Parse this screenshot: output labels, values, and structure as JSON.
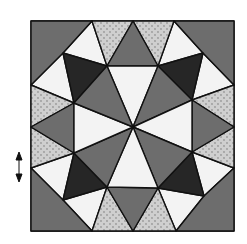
{
  "diagram": {
    "colors": {
      "background": "#ffffff",
      "outline": "#111111",
      "dark": "#262626",
      "medium": "#6d6d6d",
      "light": "#f3f3f3",
      "dotted_base": "#cfcfcf",
      "dot": "#9a9a9a"
    },
    "square": {
      "x": 31,
      "y": 21,
      "w": 203,
      "h": 210
    },
    "center": [
      133,
      127
    ],
    "scale_marker": {
      "symbol": "double-arrow-vertical",
      "x": 18,
      "y": 166
    }
  }
}
